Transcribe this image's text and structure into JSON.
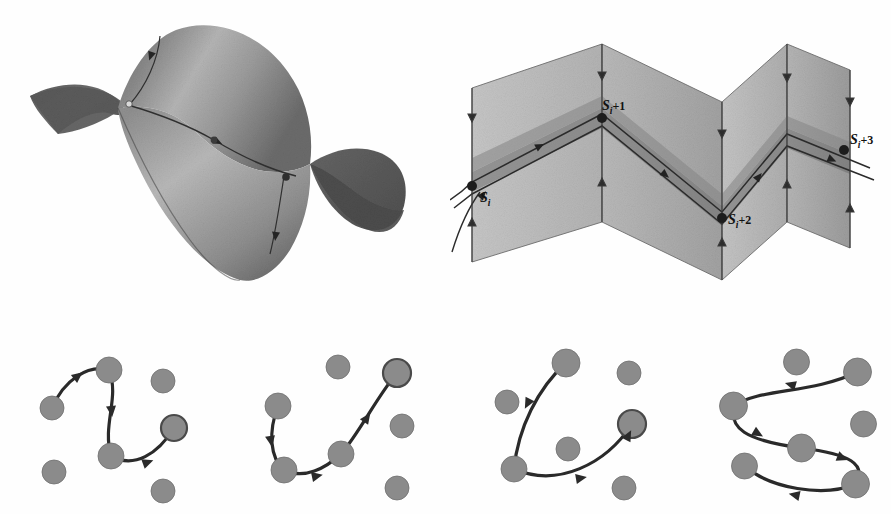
{
  "figure": {
    "background_color": "#ffffff",
    "panels": [
      {
        "id": "surface",
        "name": "saddle-surface-3d"
      },
      {
        "id": "folds",
        "name": "folded-planes-flow"
      },
      {
        "id": "graph1",
        "name": "node-graph-panel-1"
      },
      {
        "id": "graph2",
        "name": "node-graph-panel-2"
      },
      {
        "id": "graph3",
        "name": "node-graph-panel-3"
      },
      {
        "id": "graph4",
        "name": "node-graph-panel-4"
      }
    ]
  },
  "colors": {
    "background": "#ffffff",
    "surface_dark": "#595959",
    "surface_mid": "#7d7d7d",
    "surface_light": "#a8a8a8",
    "surface_highlight": "#c2c2c2",
    "plane_light": "#c9c9c9",
    "plane_mid": "#b0b0b0",
    "plane_dark": "#8f8f8f",
    "band_dark": "#707070",
    "node_fill": "#8b8b8b",
    "node_stroke": "#6e6e6e",
    "trajectory": "#2a2a2a",
    "label_color": "#111111"
  },
  "surface_panel": {
    "description": "Shaded three-dimensional saddle surface with two pointed lobes and a trajectory curve crossing it",
    "marker_points": [
      "entry-point",
      "mid-point",
      "exit-point"
    ],
    "lobe_count": 2,
    "trajectory_arrow_count": 3
  },
  "folds_panel": {
    "description": "Accordion-folded planes with a shaded band and a trajectory threading through successive surfaces of section",
    "plane_count": 4,
    "vertical_arrow_count": 8,
    "labels": [
      {
        "key": "s_i",
        "base": "S",
        "sub": "i",
        "plus": "",
        "x": 30,
        "y": 162
      },
      {
        "key": "s_i1",
        "base": "S",
        "sub": "i",
        "plus": "+1",
        "x": 152,
        "y": 87
      },
      {
        "key": "s_i2",
        "base": "S",
        "sub": "i",
        "plus": "+2",
        "x": 272,
        "y": 190
      },
      {
        "key": "s_i3",
        "base": "S",
        "sub": "i",
        "plus": "+3",
        "x": 381,
        "y": 95
      }
    ],
    "intersection_points": [
      "S_i",
      "S_i+1",
      "S_i+2",
      "S_i+3"
    ]
  },
  "graph_panels": [
    {
      "name": "node-graph-panel-1",
      "path_node_count": 4,
      "free_node_count": 3,
      "arrow_count": 3,
      "nodes": [
        {
          "cx": 36,
          "cy": 72,
          "r": 12,
          "on_path": true,
          "emphasis": false
        },
        {
          "cx": 93,
          "cy": 34,
          "r": 13,
          "on_path": true,
          "emphasis": false
        },
        {
          "cx": 95,
          "cy": 120,
          "r": 13,
          "on_path": true,
          "emphasis": false
        },
        {
          "cx": 158,
          "cy": 92,
          "r": 13,
          "on_path": true,
          "emphasis": true
        },
        {
          "cx": 147,
          "cy": 45,
          "r": 12,
          "on_path": false,
          "emphasis": false
        },
        {
          "cx": 38,
          "cy": 136,
          "r": 12,
          "on_path": false,
          "emphasis": false
        },
        {
          "cx": 147,
          "cy": 155,
          "r": 12,
          "on_path": false,
          "emphasis": false
        }
      ],
      "path": "M36,72 C48,44 72,28 93,34 C104,62 86,88 95,120 C118,133 142,118 158,92",
      "arrows": [
        {
          "x": 58,
          "y": 43,
          "angle": -38
        },
        {
          "x": 95,
          "y": 70,
          "angle": 84
        },
        {
          "x": 127,
          "y": 128,
          "angle": -20
        }
      ]
    },
    {
      "name": "node-graph-panel-2",
      "path_node_count": 4,
      "free_node_count": 3,
      "arrow_count": 3,
      "nodes": [
        {
          "cx": 36,
          "cy": 70,
          "r": 13,
          "on_path": true,
          "emphasis": false
        },
        {
          "cx": 42,
          "cy": 134,
          "r": 13,
          "on_path": true,
          "emphasis": false
        },
        {
          "cx": 99,
          "cy": 118,
          "r": 13,
          "on_path": true,
          "emphasis": false
        },
        {
          "cx": 155,
          "cy": 37,
          "r": 14,
          "on_path": true,
          "emphasis": true
        },
        {
          "cx": 96,
          "cy": 31,
          "r": 12,
          "on_path": false,
          "emphasis": false
        },
        {
          "cx": 160,
          "cy": 90,
          "r": 12,
          "on_path": false,
          "emphasis": false
        },
        {
          "cx": 155,
          "cy": 152,
          "r": 12,
          "on_path": false,
          "emphasis": false
        }
      ],
      "path": "M36,70 C26,96 28,122 42,134 C62,144 84,132 99,118 C118,96 134,62 155,37",
      "arrows": [
        {
          "x": 28,
          "y": 100,
          "angle": 80
        },
        {
          "x": 70,
          "y": 141,
          "angle": -12
        },
        {
          "x": 122,
          "y": 86,
          "angle": -55
        }
      ]
    },
    {
      "name": "node-graph-panel-3",
      "path_node_count": 3,
      "free_node_count": 4,
      "arrow_count": 3,
      "nodes": [
        {
          "cx": 100,
          "cy": 27,
          "r": 14,
          "on_path": true,
          "emphasis": false
        },
        {
          "cx": 48,
          "cy": 133,
          "r": 13,
          "on_path": true,
          "emphasis": false
        },
        {
          "cx": 166,
          "cy": 88,
          "r": 14,
          "on_path": true,
          "emphasis": true
        },
        {
          "cx": 41,
          "cy": 66,
          "r": 12,
          "on_path": false,
          "emphasis": false
        },
        {
          "cx": 163,
          "cy": 37,
          "r": 12,
          "on_path": false,
          "emphasis": false
        },
        {
          "cx": 102,
          "cy": 113,
          "r": 12,
          "on_path": false,
          "emphasis": false
        },
        {
          "cx": 158,
          "cy": 152,
          "r": 12,
          "on_path": false,
          "emphasis": false
        }
      ],
      "path": "M100,27 C72,52 52,92 48,133 C92,152 140,128 166,88",
      "arrows": [
        {
          "x": 64,
          "y": 63,
          "angle": 118
        },
        {
          "x": 110,
          "y": 143,
          "angle": -10
        },
        {
          "x": 160,
          "y": 104,
          "angle": -62
        }
      ]
    },
    {
      "name": "node-graph-panel-4",
      "path_node_count": 5,
      "free_node_count": 2,
      "arrow_count": 4,
      "nodes": [
        {
          "cx": 176,
          "cy": 36,
          "r": 14,
          "on_path": true,
          "emphasis": false
        },
        {
          "cx": 52,
          "cy": 70,
          "r": 14,
          "on_path": true,
          "emphasis": false
        },
        {
          "cx": 120,
          "cy": 112,
          "r": 14,
          "on_path": true,
          "emphasis": false
        },
        {
          "cx": 174,
          "cy": 148,
          "r": 14,
          "on_path": true,
          "emphasis": false
        },
        {
          "cx": 63,
          "cy": 130,
          "r": 13,
          "on_path": true,
          "emphasis": false
        },
        {
          "cx": 115,
          "cy": 26,
          "r": 13,
          "on_path": false,
          "emphasis": false
        },
        {
          "cx": 182,
          "cy": 88,
          "r": 13,
          "on_path": false,
          "emphasis": false
        }
      ],
      "path": "M176,36 C130,58 78,52 52,70 C48,92 62,104 120,112 C168,118 186,128 174,148 C142,162 88,152 63,130",
      "arrows": [
        {
          "x": 114,
          "y": 50,
          "angle": 196
        },
        {
          "x": 72,
          "y": 95,
          "angle": 30
        },
        {
          "x": 156,
          "y": 120,
          "angle": 22
        },
        {
          "x": 118,
          "y": 160,
          "angle": 192
        }
      ]
    }
  ]
}
